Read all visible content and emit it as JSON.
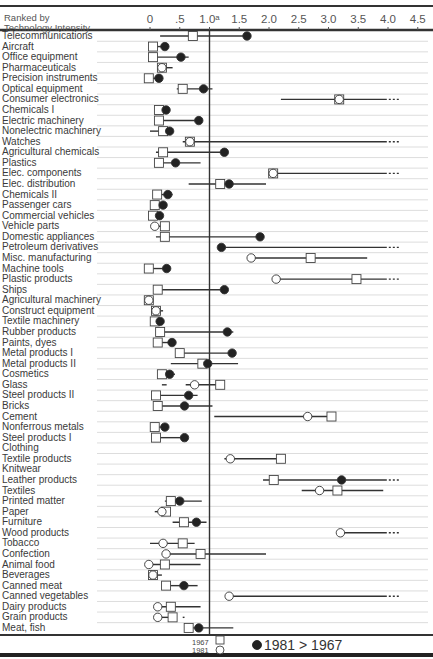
{
  "chart_data": {
    "type": "dumbbell",
    "title": "",
    "xlabel": "",
    "ylabel": "Ranked by Technology Intensity",
    "header": {
      "line1": "Ranked by",
      "line2": "Technology Intensity"
    },
    "x_ticks": [
      "0",
      ".5",
      "1.0ᵃ",
      "1.5",
      "2.0",
      "2.5",
      "3.0",
      "3.5",
      "4.0",
      "4.5"
    ],
    "x_tick_values": [
      0,
      0.5,
      1.0,
      1.5,
      2.0,
      2.5,
      3.0,
      3.5,
      4.0,
      4.5
    ],
    "xlim": [
      0,
      4.5
    ],
    "reference_line": 1.0,
    "grid": "horizontal row rules",
    "legend": {
      "square": "1967",
      "circle": "1981",
      "filled_circle": "1981 > 1967"
    },
    "rows": [
      {
        "label": "Telecommunications",
        "v1967": 0.72,
        "v1981": 1.63,
        "range": [
          0.17,
          1.63
        ],
        "filled": true
      },
      {
        "label": "Aircraft",
        "v1967": 0.05,
        "v1981": 0.25,
        "range": [
          0.05,
          0.25
        ],
        "filled": true
      },
      {
        "label": "Office equipment",
        "v1967": 0.05,
        "v1981": 0.52,
        "range": [
          0.05,
          0.65
        ],
        "filled": true
      },
      {
        "label": "Pharmaceuticals",
        "v1967": 0.2,
        "v1981": 0.2,
        "range": [
          0.12,
          0.38
        ],
        "filled": false
      },
      {
        "label": "Precision instruments",
        "v1967": -0.02,
        "v1981": 0.15,
        "range": [
          -0.02,
          0.15
        ],
        "filled": true
      },
      {
        "label": "Optical equipment",
        "v1967": 0.55,
        "v1981": 0.9,
        "range": [
          0.45,
          1.05
        ],
        "filled": true
      },
      {
        "label": "Consumer electronics",
        "v1967": 3.18,
        "v1981": 3.18,
        "range": [
          2.2,
          3.98
        ],
        "filled": false,
        "extends": true
      },
      {
        "label": "Chemicals I",
        "v1967": 0.15,
        "v1981": 0.27,
        "range": [
          0.1,
          0.27
        ],
        "filled": true
      },
      {
        "label": "Electric machinery",
        "v1967": 0.15,
        "v1981": 0.82,
        "range": [
          0.1,
          0.82
        ],
        "filled": true
      },
      {
        "label": "Nonelectric machinery",
        "v1967": 0.22,
        "v1981": 0.33,
        "range": [
          0.0,
          0.33
        ],
        "filled": true
      },
      {
        "label": "Watches",
        "v1967": 0.67,
        "v1981": 0.67,
        "range": [
          0.55,
          3.98
        ],
        "filled": false,
        "extends": true
      },
      {
        "label": "Agricultural chemicals",
        "v1967": 0.22,
        "v1981": 1.25,
        "range": [
          0.1,
          1.25
        ],
        "filled": true
      },
      {
        "label": "Plastics",
        "v1967": 0.15,
        "v1981": 0.43,
        "range": [
          0.15,
          0.85
        ],
        "filled": true
      },
      {
        "label": "Elec. components",
        "v1967": 2.07,
        "v1981": 2.07,
        "range": [
          2.07,
          3.98
        ],
        "filled": false,
        "extends": true
      },
      {
        "label": "Elec. distribution",
        "v1967": 1.18,
        "v1981": 1.33,
        "range": [
          0.65,
          1.95
        ],
        "filled": true
      },
      {
        "label": "Chemicals II",
        "v1967": 0.12,
        "v1981": 0.3,
        "range": [
          0.12,
          0.38
        ],
        "filled": true
      },
      {
        "label": "Passenger cars",
        "v1967": 0.08,
        "v1981": 0.22,
        "range": [
          0.08,
          0.22
        ],
        "filled": true
      },
      {
        "label": "Commercial vehicles",
        "v1967": 0.05,
        "v1981": 0.16,
        "range": [
          0.05,
          0.16
        ],
        "filled": true
      },
      {
        "label": "Vehicle parts",
        "v1967": 0.25,
        "v1981": 0.08,
        "range": [
          0.08,
          0.25
        ],
        "filled": false
      },
      {
        "label": "Domestic appliances",
        "v1967": 0.25,
        "v1981": 1.85,
        "range": [
          0.1,
          1.85
        ],
        "filled": true
      },
      {
        "label": "Petroleum derivatives",
        "v1967": null,
        "v1981": 1.2,
        "range": [
          1.2,
          3.98
        ],
        "filled": true,
        "extends": true
      },
      {
        "label": "Misc. manufacturing",
        "v1967": 2.7,
        "v1981": 1.7,
        "range": [
          1.65,
          3.65
        ],
        "filled": false
      },
      {
        "label": "Machine tools",
        "v1967": -0.02,
        "v1981": 0.28,
        "range": [
          -0.02,
          0.28
        ],
        "filled": true
      },
      {
        "label": "Plastic products",
        "v1967": 3.47,
        "v1981": 2.12,
        "range": [
          2.05,
          3.98
        ],
        "filled": false,
        "extends": true
      },
      {
        "label": "Ships",
        "v1967": 0.13,
        "v1981": 1.25,
        "range": [
          0.13,
          1.25
        ],
        "filled": true
      },
      {
        "label": "Agricultural machinery",
        "v1967": -0.02,
        "v1981": -0.02,
        "range": [
          -0.02,
          -0.02
        ],
        "filled": false
      },
      {
        "label": "Construct equipment",
        "v1967": 0.1,
        "v1981": 0.1,
        "range": [
          0.1,
          0.22
        ],
        "filled": false
      },
      {
        "label": "Textile machinery",
        "v1967": 0.08,
        "v1981": 0.17,
        "range": [
          0.08,
          0.17
        ],
        "filled": true
      },
      {
        "label": "Rubber products",
        "v1967": 0.17,
        "v1981": 1.3,
        "range": [
          0.1,
          1.4
        ],
        "filled": true
      },
      {
        "label": "Paints, dyes",
        "v1967": 0.13,
        "v1981": 0.37,
        "range": [
          0.07,
          0.37
        ],
        "filled": true
      },
      {
        "label": "Metal products I",
        "v1967": 0.5,
        "v1981": 1.38,
        "range": [
          0.5,
          1.38
        ],
        "filled": true
      },
      {
        "label": "Metal products II",
        "v1967": 0.88,
        "v1981": 0.97,
        "range": [
          0.35,
          1.48
        ],
        "filled": true
      },
      {
        "label": "Cosmetics",
        "v1967": 0.2,
        "v1981": 0.33,
        "range": [
          0.2,
          0.42
        ],
        "filled": true
      },
      {
        "label": "Glass",
        "v1967": 1.18,
        "v1981": 0.75,
        "range": [
          0.6,
          1.18
        ],
        "filled": false,
        "extra_segment": [
          0.2,
          0.28
        ]
      },
      {
        "label": "Steel products II",
        "v1967": 0.1,
        "v1981": 0.65,
        "range": [
          0.1,
          0.8
        ],
        "filled": true
      },
      {
        "label": "Bricks",
        "v1967": 0.13,
        "v1981": 0.58,
        "range": [
          0.08,
          1.05
        ],
        "filled": true
      },
      {
        "label": "Cement",
        "v1967": 3.05,
        "v1981": 2.65,
        "range": [
          1.08,
          3.05
        ],
        "filled": false
      },
      {
        "label": "Nonferrous metals",
        "v1967": 0.08,
        "v1981": 0.25,
        "range": [
          0.08,
          0.25
        ],
        "filled": true
      },
      {
        "label": "Steel products I",
        "v1967": 0.1,
        "v1981": 0.58,
        "range": [
          0.07,
          0.58
        ],
        "filled": true
      },
      {
        "label": "Clothing",
        "v1967": null,
        "v1981": null,
        "range": null,
        "filled": false
      },
      {
        "label": "Textile products",
        "v1967": 2.2,
        "v1981": 1.35,
        "range": [
          1.25,
          2.2
        ],
        "filled": false
      },
      {
        "label": "Knitwear",
        "v1967": null,
        "v1981": null,
        "range": null,
        "filled": false
      },
      {
        "label": "Leather products",
        "v1967": 2.08,
        "v1981": 3.22,
        "range": [
          1.9,
          3.98
        ],
        "filled": true,
        "extends": true
      },
      {
        "label": "Textiles",
        "v1967": 3.15,
        "v1981": 2.85,
        "range": [
          2.55,
          3.92
        ],
        "filled": false
      },
      {
        "label": "Printed matter",
        "v1967": 0.35,
        "v1981": 0.5,
        "range": [
          0.25,
          0.87
        ],
        "filled": true
      },
      {
        "label": "Paper",
        "v1967": 0.27,
        "v1981": 0.2,
        "range": [
          0.08,
          0.27
        ],
        "filled": false
      },
      {
        "label": "Furniture",
        "v1967": 0.57,
        "v1981": 0.78,
        "range": [
          0.38,
          0.95
        ],
        "filled": true
      },
      {
        "label": "Wood products",
        "v1967": null,
        "v1981": 3.2,
        "range": [
          3.2,
          3.98
        ],
        "filled": false,
        "extends": true
      },
      {
        "label": "Tobacco",
        "v1967": 0.55,
        "v1981": 0.22,
        "range": [
          0.0,
          0.75
        ],
        "filled": false
      },
      {
        "label": "Confection",
        "v1967": 0.85,
        "v1981": 0.27,
        "range": [
          0.2,
          1.95
        ],
        "filled": false
      },
      {
        "label": "Animal food",
        "v1967": 0.25,
        "v1981": -0.02,
        "range": [
          -0.02,
          0.85
        ],
        "filled": false
      },
      {
        "label": "Beverages",
        "v1967": 0.05,
        "v1981": 0.05,
        "range": [
          0.0,
          0.2
        ],
        "filled": false
      },
      {
        "label": "Canned meat",
        "v1967": 0.27,
        "v1981": 0.57,
        "range": [
          0.27,
          0.8
        ],
        "filled": true
      },
      {
        "label": "Canned vegetables",
        "v1967": null,
        "v1981": 1.33,
        "range": [
          1.33,
          3.98
        ],
        "filled": false,
        "extends": true
      },
      {
        "label": "Dairy products",
        "v1967": 0.35,
        "v1981": 0.13,
        "range": [
          0.13,
          0.85
        ],
        "filled": false
      },
      {
        "label": "Grain products",
        "v1967": 0.38,
        "v1981": 0.13,
        "range": [
          0.13,
          0.38
        ],
        "filled": false,
        "extra_segment": [
          0.55,
          0.58
        ]
      },
      {
        "label": "Meat, fish",
        "v1967": 0.65,
        "v1981": 0.82,
        "range": [
          0.65,
          1.4
        ],
        "filled": true
      }
    ]
  }
}
